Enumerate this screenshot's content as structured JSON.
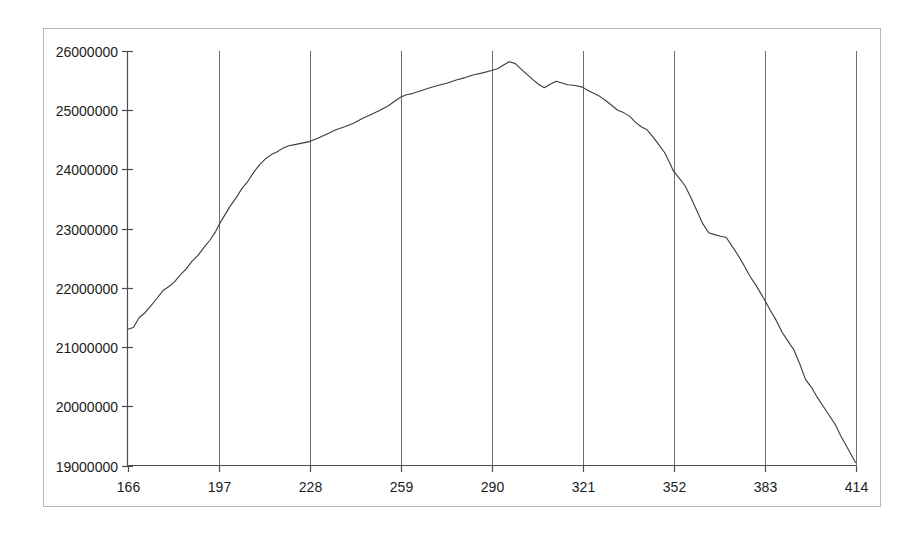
{
  "chart": {
    "background_color": "#ffffff",
    "border_color": "#b8b8b8",
    "axis_color": "#4d4d4d",
    "gridline_color": "#6e6e6e",
    "tick_color": "#4d4d4d",
    "line_color": "#3c3c3c",
    "label_color": "#1c1c1c"
  },
  "chart_data": {
    "type": "line",
    "title": "",
    "xlabel": "",
    "ylabel": "",
    "legend": "none",
    "grid": "vertical-only",
    "xlim": [
      166,
      414
    ],
    "ylim": [
      19000000,
      26000000
    ],
    "x_ticks": [
      166,
      197,
      228,
      259,
      290,
      321,
      352,
      383,
      414
    ],
    "y_ticks": [
      19000000,
      20000000,
      21000000,
      22000000,
      23000000,
      24000000,
      25000000,
      26000000
    ],
    "series": [
      {
        "name": "series-1",
        "x": [
          166,
          168,
          170,
          172,
          174,
          176,
          178,
          180,
          182,
          184,
          186,
          188,
          190,
          192,
          194,
          196,
          197,
          199,
          201,
          203,
          205,
          207,
          209,
          211,
          213,
          215,
          217,
          219,
          221,
          223,
          225,
          228,
          231,
          234,
          237,
          240,
          243,
          246,
          249,
          252,
          255,
          257,
          259,
          261,
          263,
          266,
          269,
          272,
          275,
          278,
          281,
          284,
          287,
          290,
          292,
          294,
          296,
          298,
          300,
          302,
          304,
          306,
          308,
          310,
          312,
          314,
          316,
          318,
          321,
          323,
          325,
          327,
          329,
          331,
          333,
          335,
          337,
          339,
          341,
          343,
          345,
          347,
          349,
          351,
          352,
          354,
          356,
          358,
          360,
          362,
          364,
          366,
          368,
          370,
          372,
          374,
          376,
          378,
          380,
          383,
          385,
          387,
          389,
          391,
          393,
          395,
          397,
          399,
          401,
          403,
          405,
          407,
          409,
          411,
          414
        ],
        "y": [
          21300000,
          21330000,
          21500000,
          21580000,
          21700000,
          21820000,
          21950000,
          22020000,
          22100000,
          22220000,
          22320000,
          22450000,
          22550000,
          22680000,
          22800000,
          22950000,
          23050000,
          23220000,
          23380000,
          23520000,
          23680000,
          23800000,
          23950000,
          24080000,
          24180000,
          24250000,
          24300000,
          24360000,
          24400000,
          24420000,
          24440000,
          24470000,
          24530000,
          24600000,
          24670000,
          24720000,
          24780000,
          24860000,
          24930000,
          25000000,
          25080000,
          25150000,
          25220000,
          25260000,
          25280000,
          25330000,
          25380000,
          25420000,
          25460000,
          25510000,
          25550000,
          25600000,
          25630000,
          25670000,
          25700000,
          25760000,
          25820000,
          25790000,
          25700000,
          25610000,
          25520000,
          25440000,
          25380000,
          25440000,
          25490000,
          25460000,
          25430000,
          25420000,
          25390000,
          25330000,
          25280000,
          25230000,
          25160000,
          25080000,
          25000000,
          24960000,
          24900000,
          24800000,
          24720000,
          24670000,
          24550000,
          24420000,
          24280000,
          24080000,
          23970000,
          23850000,
          23720000,
          23520000,
          23300000,
          23080000,
          22930000,
          22900000,
          22870000,
          22850000,
          22700000,
          22550000,
          22380000,
          22200000,
          22050000,
          21800000,
          21620000,
          21450000,
          21250000,
          21100000,
          20950000,
          20720000,
          20450000,
          20320000,
          20150000,
          20000000,
          19850000,
          19700000,
          19500000,
          19320000,
          19050000
        ]
      }
    ]
  }
}
